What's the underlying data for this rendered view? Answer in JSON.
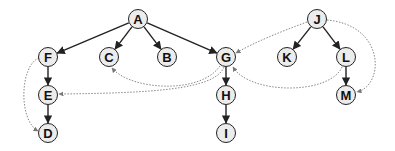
{
  "diagram": {
    "type": "directed-graph",
    "nodes": [
      {
        "id": "A",
        "label": "A",
        "x": 138,
        "y": 19
      },
      {
        "id": "F",
        "label": "F",
        "x": 48,
        "y": 57
      },
      {
        "id": "C",
        "label": "C",
        "x": 109,
        "y": 57
      },
      {
        "id": "B",
        "label": "B",
        "x": 167,
        "y": 57
      },
      {
        "id": "G",
        "label": "G",
        "x": 226,
        "y": 57
      },
      {
        "id": "J",
        "label": "J",
        "x": 317,
        "y": 19
      },
      {
        "id": "K",
        "label": "K",
        "x": 287,
        "y": 57
      },
      {
        "id": "L",
        "label": "L",
        "x": 346,
        "y": 57
      },
      {
        "id": "E",
        "label": "E",
        "x": 48,
        "y": 95
      },
      {
        "id": "H",
        "label": "H",
        "x": 226,
        "y": 95
      },
      {
        "id": "M",
        "label": "M",
        "x": 346,
        "y": 95
      },
      {
        "id": "D",
        "label": "D",
        "x": 48,
        "y": 133
      },
      {
        "id": "I",
        "label": "I",
        "x": 226,
        "y": 133
      }
    ],
    "solid_edges": [
      [
        "A",
        "F"
      ],
      [
        "A",
        "C"
      ],
      [
        "A",
        "B"
      ],
      [
        "A",
        "G"
      ],
      [
        "F",
        "E"
      ],
      [
        "E",
        "D"
      ],
      [
        "G",
        "H"
      ],
      [
        "H",
        "I"
      ],
      [
        "J",
        "K"
      ],
      [
        "J",
        "L"
      ],
      [
        "L",
        "M"
      ]
    ],
    "dotted_edges": [
      [
        "F",
        "D"
      ],
      [
        "G",
        "C"
      ],
      [
        "G",
        "E"
      ],
      [
        "J",
        "G"
      ],
      [
        "L",
        "G"
      ],
      [
        "J",
        "M"
      ]
    ],
    "colors": {
      "solid": "#222222",
      "dotted": "#888888",
      "node_fill": "#ececec"
    }
  }
}
